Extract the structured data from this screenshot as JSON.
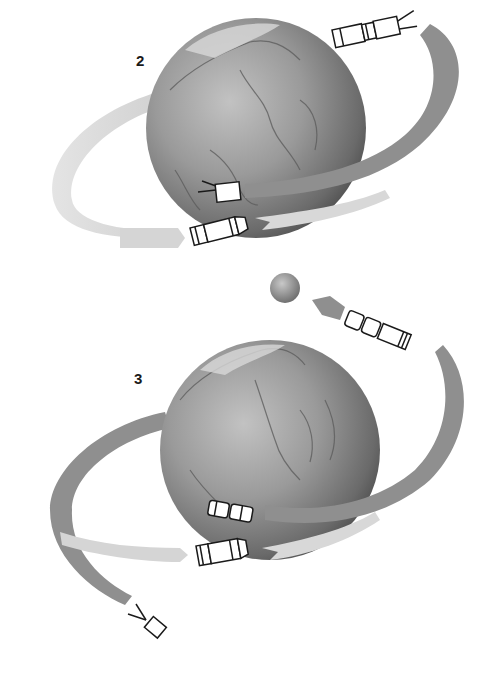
{
  "figure": {
    "panels": [
      {
        "label": "2",
        "items": [
          "earth-globe",
          "orbit-ribbon-dark",
          "orbit-ribbon-light",
          "spacecraft-with-antenna",
          "spacecraft-module-docking",
          "spacecraft-upper-right"
        ]
      },
      {
        "label": "3",
        "items": [
          "earth-globe",
          "moon",
          "orbit-ribbon-dark",
          "orbit-ribbon-light",
          "docked-spacecraft-stack",
          "spacecraft-small-antenna"
        ]
      }
    ]
  },
  "colors": {
    "background": "#ffffff",
    "globe_light": "#b9b9b9",
    "globe_mid": "#8a8a8a",
    "globe_dark": "#3f3f3f",
    "ribbon_dark": "#8f8f8f",
    "ribbon_light": "#d8d8d8",
    "spacecraft_fill": "#ffffff",
    "spacecraft_stroke": "#1a1a1a",
    "label": "#1a1a1a"
  }
}
